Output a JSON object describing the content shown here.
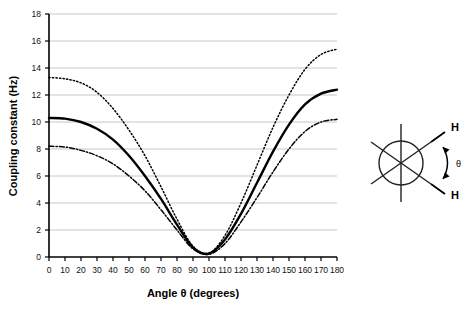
{
  "chart_data": {
    "type": "line",
    "title": "",
    "xlabel": "Angle θ (degrees)",
    "ylabel": "Coupling constant (Hz)",
    "xlim": [
      0,
      180
    ],
    "ylim": [
      0,
      18
    ],
    "xticks": [
      0,
      10,
      20,
      30,
      40,
      50,
      60,
      70,
      80,
      90,
      100,
      110,
      120,
      130,
      140,
      150,
      160,
      170,
      180
    ],
    "yticks": [
      0,
      2,
      4,
      6,
      8,
      10,
      12,
      14,
      16,
      18
    ],
    "grid": "horizontal",
    "legend": "none",
    "x": [
      0,
      10,
      20,
      30,
      40,
      50,
      60,
      70,
      80,
      90,
      100,
      110,
      120,
      130,
      140,
      150,
      160,
      170,
      180
    ],
    "series": [
      {
        "name": "upper-curve",
        "style": "dotted",
        "color": "#000000",
        "values": [
          13.3,
          13.2,
          12.9,
          12.2,
          11.0,
          9.4,
          7.5,
          5.2,
          2.8,
          0.8,
          0.3,
          1.6,
          4.0,
          6.8,
          9.6,
          12.0,
          13.9,
          15.0,
          15.4
        ]
      },
      {
        "name": "middle-curve",
        "style": "solid",
        "color": "#000000",
        "values": [
          10.3,
          10.25,
          10.0,
          9.5,
          8.7,
          7.5,
          6.0,
          4.3,
          2.4,
          0.7,
          0.25,
          1.3,
          3.2,
          5.5,
          7.8,
          9.8,
          11.3,
          12.1,
          12.4
        ]
      },
      {
        "name": "lower-curve",
        "style": "dash-dot",
        "color": "#000000",
        "values": [
          8.2,
          8.15,
          7.9,
          7.5,
          6.9,
          6.0,
          4.9,
          3.5,
          2.0,
          0.6,
          0.2,
          1.0,
          2.6,
          4.4,
          6.3,
          8.0,
          9.3,
          10.0,
          10.2
        ]
      }
    ]
  },
  "chart": {
    "ylabel": "Coupling constant (Hz)",
    "xlabel": "Angle θ (degrees)",
    "xticks": [
      "0",
      "10",
      "20",
      "30",
      "40",
      "50",
      "60",
      "70",
      "80",
      "90",
      "100",
      "110",
      "120",
      "130",
      "140",
      "150",
      "160",
      "170",
      "180"
    ],
    "yticks": [
      "0",
      "2",
      "4",
      "6",
      "8",
      "10",
      "12",
      "14",
      "16",
      "18"
    ]
  },
  "diagram": {
    "name": "newman-projection",
    "label_h_top": "H",
    "label_h_bottom": "H",
    "label_theta": "θ"
  },
  "colors": {
    "axis": "#000000",
    "grid": "#b8b8b8",
    "curve": "#000000",
    "text": "#000000"
  }
}
